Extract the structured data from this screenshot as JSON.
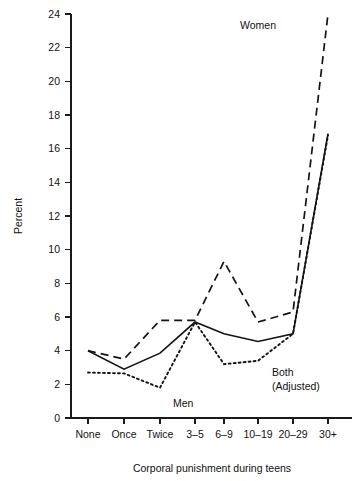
{
  "chart_data": {
    "type": "line",
    "title": "",
    "xlabel": "Corporal punishment during teens",
    "ylabel": "Percent",
    "categories": [
      "None",
      "Once",
      "Twice",
      "3–5",
      "6–9",
      "10–19",
      "20–29",
      "30+"
    ],
    "ylim": [
      0,
      24
    ],
    "ytick_step": 2,
    "yticks": [
      "0",
      "2",
      "4",
      "6",
      "8",
      "10",
      "12",
      "14",
      "16",
      "18",
      "20",
      "22",
      "24"
    ],
    "grid": false,
    "legend_position": "inline-annotations",
    "series": [
      {
        "name": "Women",
        "style": "dashed",
        "label_text": "Women",
        "values": [
          4.0,
          3.5,
          5.8,
          5.8,
          9.3,
          5.7,
          6.3,
          24.0
        ]
      },
      {
        "name": "Men",
        "style": "dotted",
        "label_text": "Men",
        "values": [
          2.7,
          2.65,
          1.8,
          5.7,
          3.2,
          3.4,
          5.0,
          16.8
        ]
      },
      {
        "name": "Both (Adjusted)",
        "style": "solid",
        "label_text": "Both\n(Adjusted)",
        "label_line1": "Both",
        "label_line2": "(Adjusted)",
        "values": [
          4.0,
          2.9,
          3.85,
          5.7,
          5.0,
          4.55,
          5.0,
          16.9
        ]
      }
    ]
  },
  "annotations": {
    "women_label": "Women",
    "men_label": "Men",
    "both_label_line1": "Both",
    "both_label_line2": "(Adjusted)"
  }
}
